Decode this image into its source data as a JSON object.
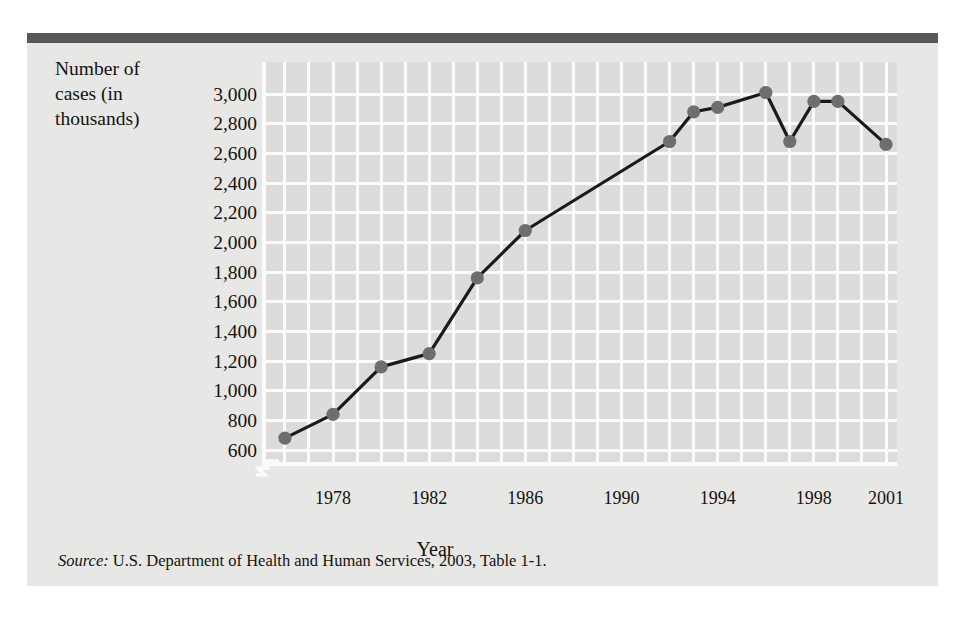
{
  "figure": {
    "ylabel": "Number of\ncases (in\nthousands)",
    "xlabel": "Year",
    "source_lead": "Source:",
    "source_text": " U.S. Department of Health and Human Services, 2003, Table 1-1.",
    "colors": {
      "panel": "#e7e7e5",
      "plot": "#dcdcda",
      "grid": "#fbfbfa",
      "top_rule": "#58585a",
      "line": "#1a1a1a",
      "marker": "#6e6e70",
      "text": "#15120f"
    }
  },
  "chart_data": {
    "type": "line",
    "title": "",
    "subtitle": "",
    "xlabel": "Year",
    "ylabel": "Number of cases (in thousands)",
    "xlim": [
      1975,
      2002
    ],
    "ylim": [
      560,
      3080
    ],
    "y_axis_break": true,
    "grid": true,
    "legend": "none",
    "ytick_labels": [
      "3,000",
      "2,800",
      "2,600",
      "2,400",
      "2,200",
      "2,000",
      "1,800",
      "1,600",
      "1,400",
      "1,200",
      "1,000",
      "800",
      "600"
    ],
    "ytick_values": [
      3000,
      2800,
      2600,
      2400,
      2200,
      2000,
      1800,
      1600,
      1400,
      1200,
      1000,
      800,
      600
    ],
    "xtick_labels": [
      "1978",
      "1982",
      "1986",
      "1990",
      "1994",
      "1998",
      "2001"
    ],
    "xtick_values": [
      1978,
      1982,
      1986,
      1990,
      1994,
      1998,
      2001
    ],
    "x": [
      1976,
      1978,
      1980,
      1982,
      1984,
      1986,
      1992,
      1993,
      1994,
      1996,
      1997,
      1998,
      1999,
      2001
    ],
    "values": [
      680,
      840,
      1160,
      1250,
      1760,
      2080,
      2680,
      2880,
      2910,
      3010,
      2680,
      2950,
      2950,
      2660
    ],
    "series": [
      {
        "name": "Number of cases (in thousands)",
        "points": [
          {
            "x": 1976,
            "y": 680
          },
          {
            "x": 1978,
            "y": 840
          },
          {
            "x": 1980,
            "y": 1160
          },
          {
            "x": 1982,
            "y": 1250
          },
          {
            "x": 1984,
            "y": 1760
          },
          {
            "x": 1986,
            "y": 2080
          },
          {
            "x": 1992,
            "y": 2680
          },
          {
            "x": 1993,
            "y": 2880
          },
          {
            "x": 1994,
            "y": 2910
          },
          {
            "x": 1996,
            "y": 3010
          },
          {
            "x": 1997,
            "y": 2680
          },
          {
            "x": 1998,
            "y": 2950
          },
          {
            "x": 1999,
            "y": 2950
          },
          {
            "x": 2001,
            "y": 2660
          }
        ]
      }
    ]
  }
}
